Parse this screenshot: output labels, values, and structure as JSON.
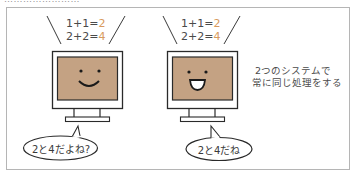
{
  "top_cut_text": "……………………",
  "colors": {
    "screen": "#c4a283",
    "answer": "#d89a5e",
    "outline": "#2a2a2a",
    "frame_border": "#b5b5b5"
  },
  "systems": [
    {
      "id": "left",
      "equations": [
        {
          "lhs": "1+1=",
          "answer": "2"
        },
        {
          "lhs": "2+2=",
          "answer": "4"
        }
      ],
      "face": "smile",
      "speech": "2と4だよね?"
    },
    {
      "id": "right",
      "equations": [
        {
          "lhs": "1+1=",
          "answer": "2"
        },
        {
          "lhs": "2+2=",
          "answer": "4"
        }
      ],
      "face": "open-smile",
      "speech": "2と4だね"
    }
  ],
  "note": {
    "line1": "2つのシステムで",
    "line2": "常に同じ処理をする"
  }
}
